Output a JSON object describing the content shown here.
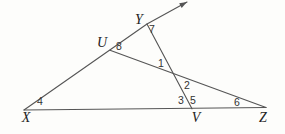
{
  "figure": {
    "width": 285,
    "height": 134,
    "background_color": "#fdfdfb",
    "stroke_color": "#555555",
    "stroke_width": 1.1,
    "vertex_label_color": "#222222",
    "angle_label_color": "#333333",
    "rays": [
      {
        "name": "ray-x-u-y-arrow",
        "description": "ray from X through U and Y with arrowhead",
        "points": [
          [
            24,
            110
          ],
          [
            147,
            24
          ],
          [
            187,
            2
          ]
        ],
        "arrow_at_end": true
      }
    ],
    "segments": [
      {
        "name": "segment-x-z",
        "from": [
          24,
          110
        ],
        "to": [
          266,
          107.5
        ]
      },
      {
        "name": "segment-y-v",
        "from": [
          147,
          24
        ],
        "to": [
          192,
          108.8
        ]
      },
      {
        "name": "segment-u-z",
        "from": [
          110,
          50.2
        ],
        "to": [
          266,
          107.5
        ]
      }
    ],
    "vertex_labels": [
      {
        "name": "vertex-label-x",
        "text": "X",
        "x": 26,
        "y": 122
      },
      {
        "name": "vertex-label-y",
        "text": "Y",
        "x": 139,
        "y": 24
      },
      {
        "name": "vertex-label-u",
        "text": "U",
        "x": 102,
        "y": 47
      },
      {
        "name": "vertex-label-v",
        "text": "V",
        "x": 196,
        "y": 122
      },
      {
        "name": "vertex-label-z",
        "text": "Z",
        "x": 263,
        "y": 122
      }
    ],
    "angle_labels": [
      {
        "name": "angle-label-1",
        "text": "1",
        "x": 161,
        "y": 67
      },
      {
        "name": "angle-label-2",
        "text": "2",
        "x": 187,
        "y": 89
      },
      {
        "name": "angle-label-3",
        "text": "3",
        "x": 181,
        "y": 104
      },
      {
        "name": "angle-label-4",
        "text": "4",
        "x": 40,
        "y": 105
      },
      {
        "name": "angle-label-5",
        "text": "5",
        "x": 193,
        "y": 104
      },
      {
        "name": "angle-label-6",
        "text": "6",
        "x": 237,
        "y": 106
      },
      {
        "name": "angle-label-7",
        "text": "7",
        "x": 152,
        "y": 33
      },
      {
        "name": "angle-label-8",
        "text": "8",
        "x": 119,
        "y": 50
      }
    ]
  }
}
